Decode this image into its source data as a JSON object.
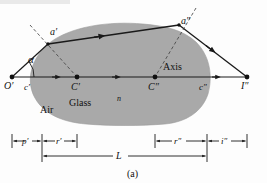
{
  "figure": {
    "caption": "(a)",
    "media": {
      "outside_label": "Air",
      "inside_label": "Glass",
      "index_label": "n"
    },
    "axis_label": "Axis",
    "angle_label": "α",
    "points": [
      {
        "id": "O-prime",
        "label": "O′",
        "x": 12,
        "y": 77
      },
      {
        "id": "C-prime",
        "label": "C′",
        "x": 77,
        "y": 77
      },
      {
        "id": "C-double",
        "label": "C″",
        "x": 155,
        "y": 77
      },
      {
        "id": "I-double",
        "label": "I″",
        "x": 247,
        "y": 77
      },
      {
        "id": "a-prime",
        "label": "a′",
        "x": 48,
        "y": 44
      },
      {
        "id": "a-double",
        "label": "a″",
        "x": 179,
        "y": 25
      }
    ],
    "ray_labels": [
      {
        "id": "c-prime",
        "label": "c′"
      },
      {
        "id": "c-double",
        "label": "c″"
      }
    ],
    "dimensions": [
      {
        "id": "p-prime",
        "label": "p′"
      },
      {
        "id": "r-prime",
        "label": "r′"
      },
      {
        "id": "r-double",
        "label": "r″"
      },
      {
        "id": "i-double",
        "label": "i″"
      },
      {
        "id": "L",
        "label": "L"
      }
    ],
    "colors": {
      "glass_fill": "#a9a9a9",
      "glass_stroke": "#8d8d8d",
      "line": "#1a1a1a",
      "dashed": "#3a3a3a",
      "background": "#fdfdfd"
    }
  }
}
